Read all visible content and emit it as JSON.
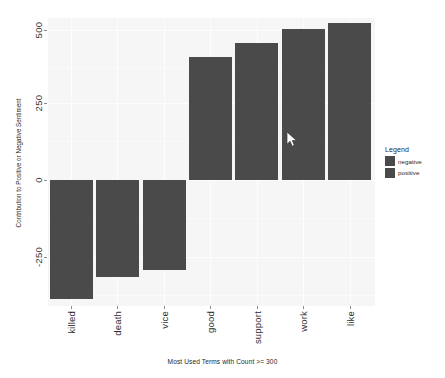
{
  "chart_data": {
    "type": "bar",
    "title": "",
    "subtitle": "",
    "xlabel": "Most Used Terms with Count >= 300",
    "ylabel": "Contribution to Positive or Negative Sentiment",
    "categories": [
      "killed",
      "death",
      "vice",
      "good",
      "support",
      "work",
      "like"
    ],
    "values": [
      -385,
      -315,
      -292,
      400,
      445,
      490,
      510
    ],
    "series": [
      {
        "name": "sentiment",
        "values": [
          -385,
          -315,
          -292,
          400,
          445,
          490,
          510
        ]
      }
    ],
    "point_groups": [
      "negative",
      "negative",
      "negative",
      "positive",
      "positive",
      "positive",
      "positive"
    ],
    "ylim": [
      -420,
      560
    ],
    "yticks": [
      500,
      250,
      0,
      -250
    ],
    "ytick_labels": [
      "500",
      "250",
      "0",
      "-250"
    ],
    "grid": true,
    "legend_position": "right",
    "legend_title": "Legend",
    "legend_entries": [
      "negative",
      "positive"
    ],
    "bar_color": "#4a4a4a",
    "panel_color": "#f6f6f6",
    "grid_color": "#fdfdfd"
  },
  "axes": {
    "y_title": "Contribution to Positive or Negative Sentiment",
    "x_title": "Most Used Terms with Count >= 300",
    "y_ticks": [
      {
        "label": "500",
        "value": 500
      },
      {
        "label": "250",
        "value": 250
      },
      {
        "label": "0",
        "value": 0
      },
      {
        "label": "-250",
        "value": -250
      }
    ],
    "x_ticks": [
      {
        "label": "killed"
      },
      {
        "label": "death"
      },
      {
        "label": "vice"
      },
      {
        "label": "good"
      },
      {
        "label": "support"
      },
      {
        "label": "work"
      },
      {
        "label": "like"
      }
    ]
  },
  "legend": {
    "title": "Legend",
    "items": [
      {
        "label": "negative",
        "color": "#4a4a4a"
      },
      {
        "label": "positive",
        "color": "#4a4a4a"
      }
    ]
  },
  "cursor": {
    "x": 286,
    "y": 131
  }
}
